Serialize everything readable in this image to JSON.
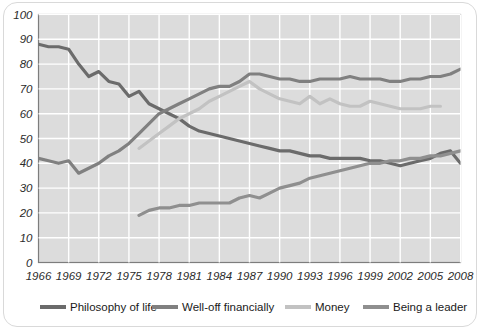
{
  "chart_data": {
    "type": "line",
    "title": "",
    "xlabel": "",
    "ylabel": "",
    "xlim": [
      1966,
      2008
    ],
    "ylim": [
      0,
      100
    ],
    "grid": true,
    "legend_position": "bottom",
    "y_ticks": [
      0,
      10,
      20,
      30,
      40,
      50,
      60,
      70,
      80,
      90,
      100
    ],
    "x_ticks": [
      1966,
      1969,
      1972,
      1975,
      1978,
      1981,
      1984,
      1987,
      1990,
      1993,
      1996,
      1999,
      2002,
      2005,
      2008
    ],
    "x_tick_labels": [
      "1966",
      "1969",
      "1972",
      "1975",
      "1978",
      "1981",
      "1984",
      "1987",
      "1990",
      "1993",
      "1996",
      "1999",
      "2002",
      "2005",
      "2008"
    ],
    "y_tick_labels": [
      "0",
      "10",
      "20",
      "30",
      "40",
      "50",
      "60",
      "70",
      "80",
      "90",
      "100"
    ],
    "plot_background": "#dcdcdc",
    "gridline_color": "#ffffff",
    "series": [
      {
        "name": "Philosophy of life",
        "color": "#6b6b6b",
        "x": [
          1966,
          1967,
          1968,
          1969,
          1970,
          1971,
          1972,
          1973,
          1974,
          1975,
          1976,
          1977,
          1978,
          1979,
          1980,
          1981,
          1982,
          1983,
          1984,
          1985,
          1986,
          1987,
          1988,
          1989,
          1990,
          1991,
          1992,
          1993,
          1994,
          1995,
          1996,
          1997,
          1998,
          1999,
          2000,
          2001,
          2002,
          2003,
          2004,
          2005,
          2006,
          2007,
          2008
        ],
        "values": [
          88,
          87,
          87,
          86,
          80,
          75,
          77,
          73,
          72,
          67,
          69,
          64,
          62,
          60,
          58,
          55,
          53,
          52,
          51,
          50,
          49,
          48,
          47,
          46,
          45,
          45,
          44,
          43,
          43,
          42,
          42,
          42,
          42,
          41,
          41,
          40,
          39,
          40,
          41,
          42,
          44,
          45,
          40
        ]
      },
      {
        "name": "Well-off financially",
        "color": "#808080",
        "x": [
          1966,
          1967,
          1968,
          1969,
          1970,
          1971,
          1972,
          1973,
          1974,
          1975,
          1976,
          1977,
          1978,
          1979,
          1980,
          1981,
          1982,
          1983,
          1984,
          1985,
          1986,
          1987,
          1988,
          1989,
          1990,
          1991,
          1992,
          1993,
          1994,
          1995,
          1996,
          1997,
          1998,
          1999,
          2000,
          2001,
          2002,
          2003,
          2004,
          2005,
          2006,
          2007,
          2008
        ],
        "values": [
          42,
          41,
          40,
          41,
          36,
          38,
          40,
          43,
          45,
          48,
          52,
          56,
          60,
          62,
          64,
          66,
          68,
          70,
          71,
          71,
          73,
          76,
          76,
          75,
          74,
          74,
          73,
          73,
          74,
          74,
          74,
          75,
          74,
          74,
          74,
          73,
          73,
          74,
          74,
          75,
          75,
          76,
          78
        ]
      },
      {
        "name": "Money",
        "color": "#c2c2c2",
        "x": [
          1976,
          1977,
          1978,
          1979,
          1980,
          1981,
          1982,
          1983,
          1984,
          1985,
          1986,
          1987,
          1988,
          1989,
          1990,
          1991,
          1992,
          1993,
          1994,
          1995,
          1996,
          1997,
          1998,
          1999,
          2000,
          2001,
          2002,
          2003,
          2004,
          2005,
          2006
        ],
        "values": [
          46,
          49,
          52,
          55,
          58,
          60,
          62,
          65,
          67,
          69,
          71,
          73,
          70,
          68,
          66,
          65,
          64,
          67,
          64,
          66,
          64,
          63,
          63,
          65,
          64,
          63,
          62,
          62,
          62,
          63,
          63
        ]
      },
      {
        "name": "Being a leader",
        "color": "#8f8f8f",
        "x": [
          1976,
          1977,
          1978,
          1979,
          1980,
          1981,
          1982,
          1983,
          1984,
          1985,
          1986,
          1987,
          1988,
          1989,
          1990,
          1991,
          1992,
          1993,
          1994,
          1995,
          1996,
          1997,
          1998,
          1999,
          2000,
          2001,
          2002,
          2003,
          2004,
          2005,
          2006,
          2007,
          2008
        ],
        "values": [
          19,
          21,
          22,
          22,
          23,
          23,
          24,
          24,
          24,
          24,
          26,
          27,
          26,
          28,
          30,
          31,
          32,
          34,
          35,
          36,
          37,
          38,
          39,
          40,
          40,
          41,
          41,
          42,
          42,
          43,
          43,
          44,
          45
        ]
      }
    ]
  },
  "legend": {
    "items": [
      {
        "label": "Philosophy of life",
        "color": "#6b6b6b"
      },
      {
        "label": "Well-off financially",
        "color": "#808080"
      },
      {
        "label": "Money",
        "color": "#c2c2c2"
      },
      {
        "label": "Being a leader",
        "color": "#8f8f8f"
      }
    ]
  }
}
